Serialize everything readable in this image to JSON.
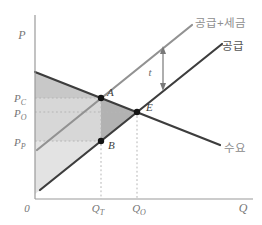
{
  "figure": {
    "type": "supply-demand-tax-incidence-diagram",
    "axis_labels": {
      "price": "P",
      "quantity": "Q",
      "origin": "0"
    },
    "curve_labels": {
      "supply_tax": "공급+세금",
      "supply": "공급",
      "demand": "수요"
    },
    "point_labels": {
      "a": "A",
      "e": "E",
      "b": "B"
    },
    "price_labels": {
      "pc": {
        "main": "P",
        "sub": "C"
      },
      "po": {
        "main": "P",
        "sub": "O"
      },
      "pp": {
        "main": "P",
        "sub": "P"
      }
    },
    "quantity_labels": {
      "qt": {
        "main": "Q",
        "sub": "T"
      },
      "qo": {
        "main": "Q",
        "sub": "O"
      }
    },
    "tax_label": "t",
    "colors": {
      "demand_line": "#3d3d3d",
      "supply_line": "#3d3d3d",
      "supply_tax_line": "#929292",
      "supply_tax_label": "#8e8e8e",
      "supply_label": "#565656",
      "demand_label": "#8a8a8a",
      "axis": "#9a9a9a",
      "guide_dots": "#b5b5b5",
      "consumer_surplus_fill": "#c8c8c8",
      "tax_revenue_fill": "#d7d7d7",
      "producer_surplus_fill": "#e3e3e3",
      "deadweight_loss_fill": "#b2b2b2",
      "point_dot": "#141414",
      "tax_arrow": "#787878"
    }
  }
}
